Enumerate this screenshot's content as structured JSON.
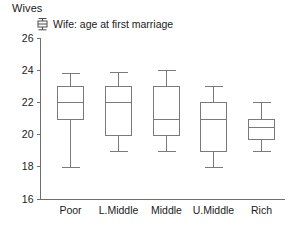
{
  "panel": {
    "title": "Wives"
  },
  "legend": {
    "icon": "boxplot-glyph-icon",
    "label": "Wife: age at first marriage",
    "position": "top-left-inside"
  },
  "colors": {
    "axis": "#6f6f6f",
    "box_stroke": "#7a7a7a",
    "text": "#1a1a1a",
    "background": "#ffffff"
  },
  "chart_data": {
    "type": "box",
    "title": "Wives",
    "xlabel": "",
    "ylabel": "",
    "ylim": [
      16,
      26
    ],
    "yticks": [
      16,
      18,
      20,
      22,
      24,
      26
    ],
    "grid": false,
    "legend": [
      "Wife: age at first marriage"
    ],
    "categories": [
      "Poor",
      "L.Middle",
      "Middle",
      "U.Middle",
      "Rich"
    ],
    "series": [
      {
        "name": "Wife: age at first marriage",
        "boxes": [
          {
            "category": "Poor",
            "whisker_low": 18.0,
            "q1": 21.0,
            "median": 22.0,
            "q3": 23.0,
            "whisker_high": 23.8
          },
          {
            "category": "L.Middle",
            "whisker_low": 19.0,
            "q1": 20.0,
            "median": 22.0,
            "q3": 23.0,
            "whisker_high": 23.9
          },
          {
            "category": "Middle",
            "whisker_low": 19.0,
            "q1": 20.0,
            "median": 21.0,
            "q3": 23.0,
            "whisker_high": 24.0
          },
          {
            "category": "U.Middle",
            "whisker_low": 18.0,
            "q1": 19.0,
            "median": 21.0,
            "q3": 22.0,
            "whisker_high": 23.0
          },
          {
            "category": "Rich",
            "whisker_low": 19.0,
            "q1": 19.7,
            "median": 20.5,
            "q3": 21.0,
            "whisker_high": 22.0
          }
        ]
      }
    ]
  }
}
